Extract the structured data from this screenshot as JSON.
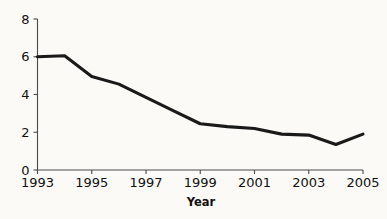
{
  "chart_data": {
    "type": "line",
    "title": "",
    "subtitle": "",
    "xlabel": "Year",
    "ylabel": "",
    "grid": false,
    "legend": false,
    "legend_position": "none",
    "xlim": [
      1993,
      2005
    ],
    "ylim": [
      0,
      8
    ],
    "x": [
      1993,
      1994,
      1995,
      1996,
      1997,
      1998,
      1999,
      2000,
      2001,
      2002,
      2003,
      2004,
      2005
    ],
    "xtick_labels": [
      "1993",
      "1995",
      "1997",
      "1999",
      "2001",
      "2003",
      "2005"
    ],
    "xtick_values": [
      1993,
      1995,
      1997,
      1999,
      2001,
      2003,
      2005
    ],
    "ytick_labels": [
      "0",
      "2",
      "4",
      "6",
      "8"
    ],
    "ytick_values": [
      0,
      2,
      4,
      6,
      8
    ],
    "series": [
      {
        "name": "value",
        "color": "#1a1a1a",
        "values": [
          6.0,
          6.05,
          4.95,
          4.55,
          3.85,
          3.15,
          2.45,
          2.3,
          2.2,
          1.9,
          1.85,
          1.35,
          1.9
        ]
      }
    ],
    "annotations": []
  },
  "axes": {
    "x_axis_title": "Year",
    "y_axis_title": ""
  },
  "colors": {
    "background": "#fbfaf7",
    "line": "#1a1a1a",
    "axis": "#4a4a4a",
    "text": "#111111"
  }
}
